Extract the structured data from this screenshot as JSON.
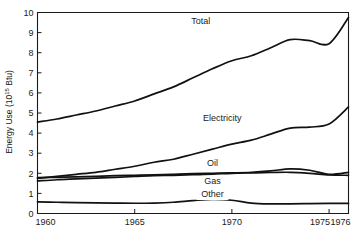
{
  "chart_data": {
    "type": "line",
    "title": "",
    "xlabel": "",
    "ylabel": "Energy Use (10",
    "ylabel_exponent": "15",
    "ylabel_suffix": " Btu)",
    "ylabel_full": "Energy Use (10^15 Btu)",
    "xlim": [
      1960,
      1976
    ],
    "ylim": [
      0,
      10
    ],
    "grid": false,
    "legend_position": "inline-labels",
    "xticks": [
      1960,
      1965,
      1970,
      1975,
      1976
    ],
    "xtick_labels": [
      "1960",
      "1965",
      "1970",
      "1975",
      "1976"
    ],
    "yticks": [
      0,
      1,
      2,
      3,
      4,
      5,
      6,
      7,
      8,
      9,
      10
    ],
    "ytick_labels": [
      "0",
      "1",
      "2",
      "3",
      "4",
      "5",
      "6",
      "7",
      "8",
      "9",
      "10"
    ],
    "x": [
      1960,
      1961,
      1962,
      1963,
      1964,
      1965,
      1966,
      1967,
      1968,
      1969,
      1970,
      1971,
      1972,
      1973,
      1974,
      1975,
      1976
    ],
    "series": [
      {
        "name": "Total",
        "label": "Total",
        "label_x": 1968.4,
        "label_y": 9.45,
        "values": [
          4.55,
          4.7,
          4.9,
          5.1,
          5.35,
          5.6,
          5.95,
          6.3,
          6.75,
          7.2,
          7.6,
          7.85,
          8.25,
          8.65,
          8.6,
          8.45,
          9.75
        ]
      },
      {
        "name": "Electricity",
        "label": "Electricity",
        "label_x": 1969.5,
        "label_y": 4.6,
        "values": [
          1.75,
          1.85,
          1.95,
          2.05,
          2.2,
          2.35,
          2.55,
          2.7,
          2.95,
          3.2,
          3.45,
          3.65,
          3.95,
          4.25,
          4.3,
          4.45,
          5.3
        ]
      },
      {
        "name": "Oil",
        "label": "Oil",
        "label_x": 1969.0,
        "label_y": 2.35,
        "values": [
          1.78,
          1.8,
          1.82,
          1.85,
          1.88,
          1.9,
          1.92,
          1.95,
          1.98,
          2.0,
          2.02,
          2.05,
          2.12,
          2.22,
          2.15,
          1.95,
          2.05
        ]
      },
      {
        "name": "Gas",
        "label": "Gas",
        "label_x": 1969.0,
        "label_y": 1.48,
        "values": [
          1.62,
          1.68,
          1.72,
          1.76,
          1.8,
          1.84,
          1.88,
          1.9,
          1.93,
          1.96,
          2.0,
          2.02,
          2.04,
          2.05,
          2.0,
          1.92,
          1.9
        ]
      },
      {
        "name": "Other",
        "label": "Other",
        "label_x": 1969.0,
        "label_y": 0.82,
        "values": [
          0.58,
          0.56,
          0.54,
          0.53,
          0.52,
          0.51,
          0.52,
          0.56,
          0.64,
          0.7,
          0.66,
          0.52,
          0.48,
          0.48,
          0.49,
          0.5,
          0.5
        ]
      }
    ],
    "colors": {
      "axis": "#1a1a1a",
      "line": "#111111",
      "background": "#ffffff"
    }
  }
}
